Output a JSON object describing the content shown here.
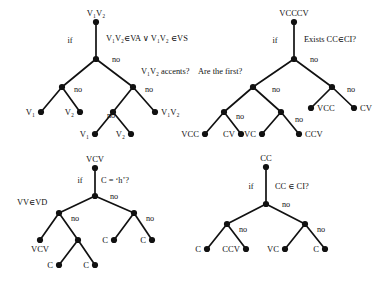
{
  "figure": {
    "background_color": "#ffffff",
    "ink_color": "#111111",
    "node_radius": 3.1
  },
  "trees": [
    {
      "id": "tree-v1v2",
      "root_label": "V₁V₂",
      "if_label": "if",
      "no_label": "no",
      "conditions": [
        "V₁V₂∈VA ∨ V₁V₂ ∈VS",
        "V₁V₂ accents?"
      ],
      "leaves": [
        "V₁",
        "V₂",
        "V₁",
        "V₂",
        "V₁V₂"
      ]
    },
    {
      "id": "tree-vcccv",
      "root_label": "VCCCV",
      "if_label": "if",
      "no_label": "no",
      "conditions": [
        "Exists CC∈CI?",
        "Are the first?"
      ],
      "leaves": [
        "VCC",
        "CV",
        "VC",
        "CCV",
        "VCC",
        "CV"
      ]
    },
    {
      "id": "tree-vcv",
      "root_label": "VCV",
      "if_label": "if",
      "no_label": "no",
      "conditions": [
        "C = ‘h’?",
        "VV∈VD"
      ],
      "leaves": [
        "VCV",
        "C",
        "C",
        "C",
        "C"
      ]
    },
    {
      "id": "tree-cc",
      "root_label": "CC",
      "if_label": "if",
      "no_label": "no",
      "conditions": [
        "CC ∈ CI?"
      ],
      "leaves": [
        "C",
        "CCV",
        "VC",
        "C"
      ]
    }
  ],
  "labels": {
    "t1_root": "V₁V₂",
    "t1_if": "if",
    "t1_cond1": "V₁V₂∈VA ∨ V₁V₂ ∈VS",
    "t1_no1": "no",
    "t1_cond2": "V₁V₂ accents?",
    "t1_no2": "no",
    "t1_no3": "no",
    "t1_no4": "no",
    "t1_leaf1": "V₁",
    "t1_leaf2": "V₂",
    "t1_leaf3": "V₁",
    "t1_leaf4": "V₂",
    "t1_leaf5": "V₁V₂",
    "t2_root": "VCCCV",
    "t2_if": "if",
    "t2_cond1": "Exists CC∈CI?",
    "t2_no1": "no",
    "t2_cond2": "Are the first?",
    "t2_no2": "no",
    "t2_no3": "no",
    "t2_no4": "no",
    "t2_no5": "no",
    "t2_leaf1": "VCC",
    "t2_leaf2": "CV",
    "t2_leaf3": "VC",
    "t2_leaf4": "CCV",
    "t2_leaf5": "VCC",
    "t2_leaf6": "CV",
    "t3_root": "VCV",
    "t3_if": "if",
    "t3_cond1": "C = ‘h’?",
    "t3_no1": "no",
    "t3_cond2": "VV∈VD",
    "t3_no2": "no",
    "t3_no3": "no",
    "t3_leaf1": "VCV",
    "t3_leaf2": "C",
    "t3_leaf3": "C",
    "t3_leaf4": "C",
    "t3_leaf5": "C",
    "t4_root": "CC",
    "t4_if": "if",
    "t4_cond1": "CC ∈ CI?",
    "t4_no1": "no",
    "t4_no2": "no",
    "t4_no3": "no",
    "t4_leaf1": "C",
    "t4_leaf2": "CCV",
    "t4_leaf3": "VC",
    "t4_leaf4": "C"
  }
}
